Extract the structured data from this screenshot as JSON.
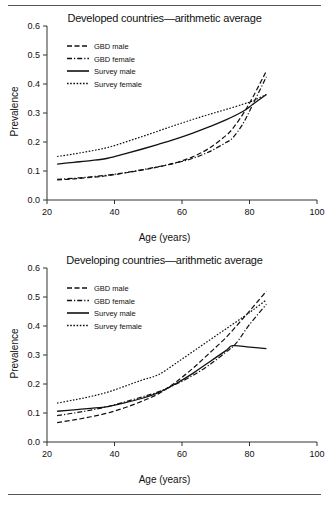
{
  "figures": [
    {
      "id": "developed",
      "title": "Developed countries—arithmetic average",
      "xlabel": "Age (years)",
      "ylabel": "Prevalence"
    },
    {
      "id": "developing",
      "title": "Developing countries—arithmetic average",
      "xlabel": "Age (years)",
      "ylabel": "Prevalence"
    }
  ],
  "axis": {
    "x_ticks": [
      "20",
      "40",
      "60",
      "80",
      "100"
    ],
    "y_ticks": [
      "0.0",
      "0.1",
      "0.2",
      "0.3",
      "0.4",
      "0.5",
      "0.6"
    ]
  },
  "legend": {
    "items": [
      {
        "label": "GBD male",
        "style": "dashed"
      },
      {
        "label": "GBD female",
        "style": "dash-dot"
      },
      {
        "label": "Survey male",
        "style": "solid"
      },
      {
        "label": "Survey female",
        "style": "dotted"
      }
    ]
  },
  "chart_data": [
    {
      "type": "line",
      "title": "Developed countries—arithmetic average",
      "xlabel": "Age (years)",
      "ylabel": "Prevalence",
      "xlim": [
        20,
        100
      ],
      "ylim": [
        0.0,
        0.6
      ],
      "xticks": [
        20,
        40,
        60,
        80,
        100
      ],
      "yticks": [
        0.0,
        0.1,
        0.2,
        0.3,
        0.4,
        0.5,
        0.6
      ],
      "grid": false,
      "legend_position": "upper-left",
      "series": [
        {
          "name": "GBD male",
          "style": "dashed",
          "x": [
            23,
            28,
            33,
            38,
            43,
            48,
            53,
            58,
            63,
            68,
            73,
            75,
            78,
            81,
            85
          ],
          "y": [
            0.069,
            0.073,
            0.078,
            0.084,
            0.093,
            0.103,
            0.114,
            0.128,
            0.148,
            0.178,
            0.222,
            0.246,
            0.295,
            0.355,
            0.445
          ]
        },
        {
          "name": "GBD female",
          "style": "dash-dot",
          "x": [
            23,
            28,
            33,
            38,
            43,
            48,
            53,
            58,
            63,
            68,
            73,
            75,
            78,
            81,
            85
          ],
          "y": [
            0.071,
            0.075,
            0.08,
            0.086,
            0.094,
            0.104,
            0.115,
            0.127,
            0.143,
            0.166,
            0.198,
            0.214,
            0.262,
            0.33,
            0.425
          ]
        },
        {
          "name": "Survey male",
          "style": "solid",
          "x": [
            23,
            28,
            33,
            38,
            43,
            48,
            53,
            58,
            63,
            68,
            73,
            78,
            81,
            85
          ],
          "y": [
            0.124,
            0.13,
            0.136,
            0.144,
            0.159,
            0.175,
            0.192,
            0.21,
            0.23,
            0.252,
            0.276,
            0.305,
            0.33,
            0.364
          ]
        },
        {
          "name": "Survey female",
          "style": "dotted",
          "x": [
            23,
            28,
            33,
            38,
            43,
            48,
            53,
            58,
            63,
            68,
            73,
            78,
            81,
            85
          ],
          "y": [
            0.15,
            0.159,
            0.169,
            0.181,
            0.199,
            0.218,
            0.238,
            0.258,
            0.277,
            0.295,
            0.312,
            0.33,
            0.342,
            0.364
          ]
        }
      ]
    },
    {
      "type": "line",
      "title": "Developing countries—arithmetic average",
      "xlabel": "Age (years)",
      "ylabel": "Prevalence",
      "xlim": [
        20,
        100
      ],
      "ylim": [
        0.0,
        0.6
      ],
      "xticks": [
        20,
        40,
        60,
        80,
        100
      ],
      "yticks": [
        0.0,
        0.1,
        0.2,
        0.3,
        0.4,
        0.5,
        0.6
      ],
      "grid": false,
      "legend_position": "upper-left",
      "series": [
        {
          "name": "GBD male",
          "style": "dashed",
          "x": [
            23,
            28,
            33,
            38,
            43,
            48,
            53,
            58,
            63,
            68,
            73,
            78,
            81,
            85
          ],
          "y": [
            0.067,
            0.076,
            0.087,
            0.1,
            0.118,
            0.14,
            0.166,
            0.205,
            0.252,
            0.305,
            0.36,
            0.425,
            0.465,
            0.52
          ]
        },
        {
          "name": "GBD female",
          "style": "dash-dot",
          "x": [
            23,
            28,
            33,
            38,
            43,
            48,
            53,
            58,
            63,
            68,
            73,
            76,
            80,
            85
          ],
          "y": [
            0.091,
            0.1,
            0.11,
            0.122,
            0.138,
            0.155,
            0.173,
            0.198,
            0.228,
            0.265,
            0.31,
            0.34,
            0.405,
            0.475
          ]
        },
        {
          "name": "Survey male",
          "style": "solid",
          "x": [
            23,
            28,
            33,
            38,
            43,
            48,
            53,
            58,
            63,
            68,
            73,
            75,
            80,
            85
          ],
          "y": [
            0.106,
            0.111,
            0.116,
            0.122,
            0.135,
            0.15,
            0.17,
            0.2,
            0.235,
            0.275,
            0.315,
            0.332,
            0.327,
            0.322
          ]
        },
        {
          "name": "Survey female",
          "style": "dotted",
          "x": [
            23,
            28,
            33,
            38,
            43,
            48,
            53,
            58,
            63,
            68,
            73,
            78,
            81,
            85
          ],
          "y": [
            0.134,
            0.145,
            0.157,
            0.172,
            0.192,
            0.213,
            0.232,
            0.27,
            0.31,
            0.35,
            0.39,
            0.43,
            0.455,
            0.49
          ]
        }
      ]
    }
  ]
}
